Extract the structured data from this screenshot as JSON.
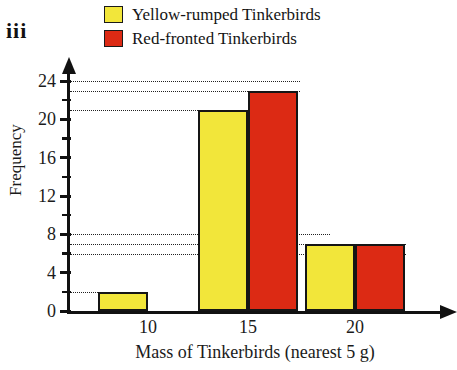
{
  "part_label": "iii",
  "legend": {
    "items": [
      {
        "label": "Yellow-rumped Tinkerbirds",
        "color": "#F2E63A",
        "swatch_name": "legend-swatch-yellow"
      },
      {
        "label": "Red-fronted Tinkerbirds",
        "color": "#DC2A14",
        "swatch_name": "legend-swatch-red"
      }
    ]
  },
  "axes": {
    "y_title": "Frequency",
    "x_title": "Mass of Tinkerbirds (nearest 5 g)",
    "y_major_labels": [
      "0",
      "4",
      "8",
      "12",
      "16",
      "20",
      "24"
    ],
    "x_labels": [
      "10",
      "15",
      "20"
    ]
  },
  "chart_data": {
    "type": "bar",
    "title": "",
    "subtitle": "",
    "xlabel": "Mass of Tinkerbirds (nearest 5 g)",
    "ylabel": "Frequency",
    "categories": [
      "10",
      "15",
      "20"
    ],
    "series": [
      {
        "name": "Yellow-rumped Tinkerbirds",
        "color": "#F2E63A",
        "values": [
          2,
          21,
          7
        ]
      },
      {
        "name": "Red-fronted Tinkerbirds",
        "color": "#DC2A14",
        "values": [
          0,
          23,
          7
        ]
      }
    ],
    "ylim": [
      0,
      24
    ],
    "y_major_ticks": [
      0,
      4,
      8,
      12,
      16,
      20,
      24
    ],
    "y_minor_ticks": [
      2,
      6,
      10,
      14,
      18,
      22
    ],
    "grid": "dotted reference lines at bar-top values: 2, 6, 7, 8, 21, 23, 24",
    "gridline_values": [
      2,
      6,
      7,
      8,
      21,
      23,
      24
    ],
    "legend_position": "top"
  }
}
